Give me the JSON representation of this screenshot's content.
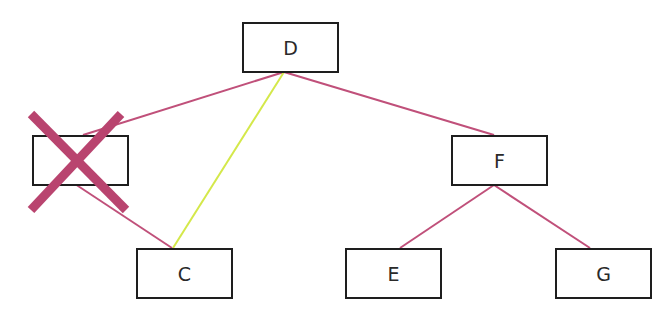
{
  "diagram": {
    "type": "tree",
    "nodes": [
      {
        "id": "B",
        "label": "",
        "x": 32,
        "y": 135,
        "deleted": true
      },
      {
        "id": "D",
        "label": "D",
        "x": 242,
        "y": 22,
        "deleted": false
      },
      {
        "id": "F",
        "label": "F",
        "x": 451,
        "y": 135,
        "deleted": false
      },
      {
        "id": "C",
        "label": "C",
        "x": 136,
        "y": 248,
        "deleted": false
      },
      {
        "id": "E",
        "label": "E",
        "x": 345,
        "y": 248,
        "deleted": false
      },
      {
        "id": "G",
        "label": "G",
        "x": 555,
        "y": 248,
        "deleted": false
      }
    ],
    "edges": [
      {
        "from": "D",
        "to": "B",
        "color": "#c0507a",
        "x1": 284,
        "y1": 72,
        "x2": 83,
        "y2": 135
      },
      {
        "from": "D",
        "to": "F",
        "color": "#c0507a",
        "x1": 284,
        "y1": 72,
        "x2": 494,
        "y2": 135
      },
      {
        "from": "D",
        "to": "C",
        "color": "#d4e84a",
        "x1": 284,
        "y1": 72,
        "x2": 173,
        "y2": 248
      },
      {
        "from": "B",
        "to": "C",
        "color": "#c0507a",
        "x1": 75,
        "y1": 184,
        "x2": 172,
        "y2": 248
      },
      {
        "from": "F",
        "to": "E",
        "color": "#c0507a",
        "x1": 494,
        "y1": 185,
        "x2": 400,
        "y2": 248
      },
      {
        "from": "F",
        "to": "G",
        "color": "#c0507a",
        "x1": 494,
        "y1": 185,
        "x2": 590,
        "y2": 248
      }
    ],
    "delete_mark": {
      "target": "B",
      "color": "#b9446f",
      "stroke_width": 9,
      "line1": {
        "x1": 31,
        "y1": 114,
        "x2": 126,
        "y2": 210
      },
      "line2": {
        "x1": 121,
        "y1": 114,
        "x2": 31,
        "y2": 210
      }
    }
  },
  "colors": {
    "edge": "#c0507a",
    "highlight_edge": "#d4e84a",
    "delete_mark": "#b9446f",
    "node_border": "#1e1e1e",
    "background": "#ffffff"
  }
}
